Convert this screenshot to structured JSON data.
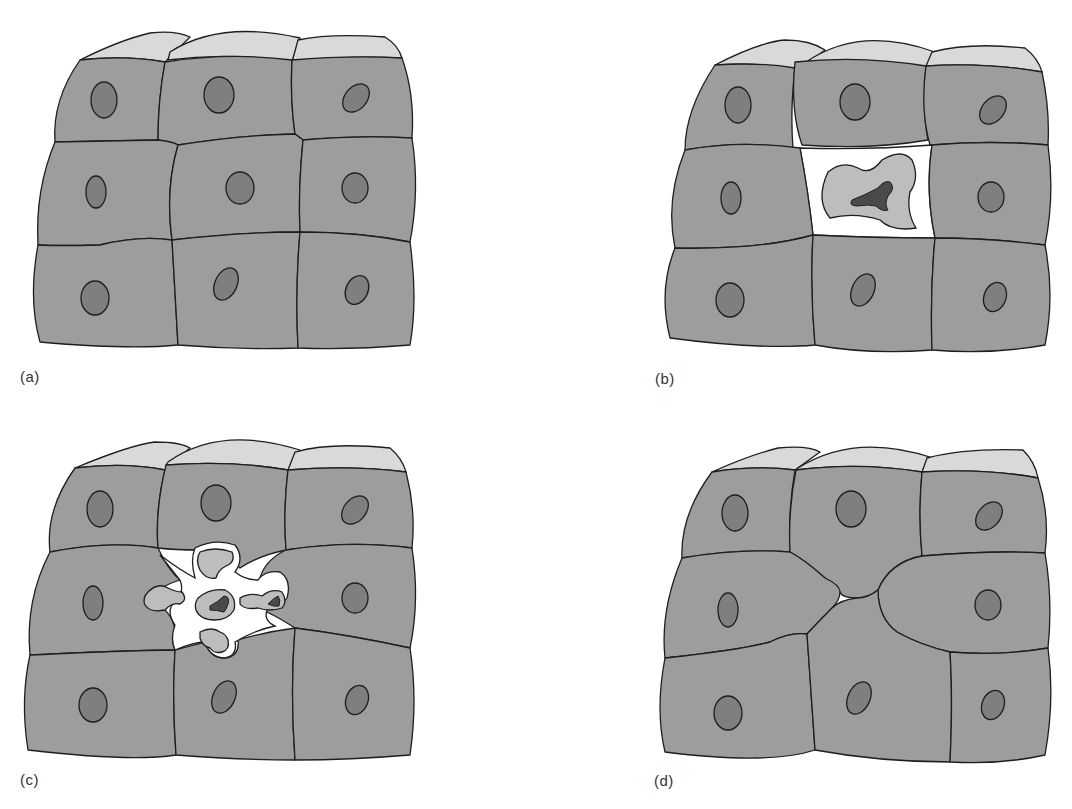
{
  "figure": {
    "running_head": "…y by apoptosis … cells",
    "panels": [
      {
        "id": "a",
        "label": "(a)",
        "stage": "intact epithelium"
      },
      {
        "id": "b",
        "label": "(b)",
        "stage": "cell shrinkage and nuclear condensation"
      },
      {
        "id": "c",
        "label": "(c)",
        "stage": "fragmentation into apoptotic bodies"
      },
      {
        "id": "d",
        "label": "(d)",
        "stage": "neighbouring cells close the gap"
      }
    ]
  },
  "colors": {
    "cell_body": "#9d9d9d",
    "cell_top": "#d9d9d9",
    "nucleus": "#7f7f7f",
    "apoptotic_cytoplasm": "#bdbdbd",
    "pyknotic_nucleus": "#4a4a4a",
    "outline": "#1e1e1e"
  }
}
